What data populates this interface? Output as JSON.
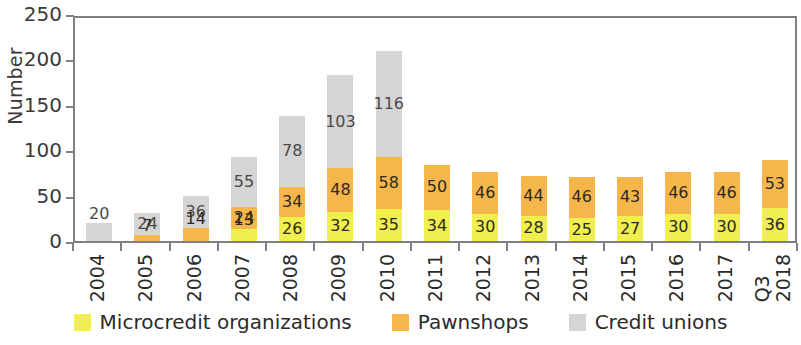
{
  "chart_data": {
    "type": "bar",
    "subtype": "stacked",
    "title": "",
    "xlabel": "",
    "ylabel": "Number",
    "ylim": [
      0,
      250
    ],
    "ytick_step": 50,
    "yticks": [
      0,
      50,
      100,
      150,
      200,
      250
    ],
    "grid": false,
    "legend_position": "bottom",
    "categories": [
      "2004",
      "2005",
      "2006",
      "2007",
      "2008",
      "2009",
      "2010",
      "2011",
      "2012",
      "2013",
      "2014",
      "2015",
      "2016",
      "2017",
      "Q3 2018"
    ],
    "category_lines": [
      [
        "2004"
      ],
      [
        "2005"
      ],
      [
        "2006"
      ],
      [
        "2007"
      ],
      [
        "2008"
      ],
      [
        "2009"
      ],
      [
        "2010"
      ],
      [
        "2011"
      ],
      [
        "2012"
      ],
      [
        "2013"
      ],
      [
        "2014"
      ],
      [
        "2015"
      ],
      [
        "2016"
      ],
      [
        "2017"
      ],
      [
        "Q3",
        "2018"
      ]
    ],
    "series": [
      {
        "name": "Microcredit organizations",
        "color": "#EFEF4E",
        "values": [
          null,
          null,
          null,
          13,
          26,
          32,
          35,
          34,
          30,
          28,
          25,
          27,
          30,
          30,
          36
        ]
      },
      {
        "name": "Pawnshops",
        "color": "#F5B74B",
        "values": [
          null,
          7,
          14,
          24,
          34,
          48,
          58,
          50,
          46,
          44,
          46,
          43,
          46,
          46,
          53
        ]
      },
      {
        "name": "Credit unions",
        "color": "#D5D5D5",
        "values": [
          20,
          24,
          36,
          55,
          78,
          103,
          116,
          null,
          null,
          null,
          null,
          null,
          null,
          null,
          null
        ]
      }
    ],
    "totals": [
      20,
      31,
      50,
      92,
      138,
      183,
      209,
      84,
      76,
      72,
      71,
      70,
      76,
      76,
      89
    ]
  },
  "legend": {
    "items": [
      {
        "label": "Microcredit organizations",
        "color": "#EFEF4E"
      },
      {
        "label": "Pawnshops",
        "color": "#F5B74B"
      },
      {
        "label": "Credit unions",
        "color": "#D5D5D5"
      }
    ]
  }
}
